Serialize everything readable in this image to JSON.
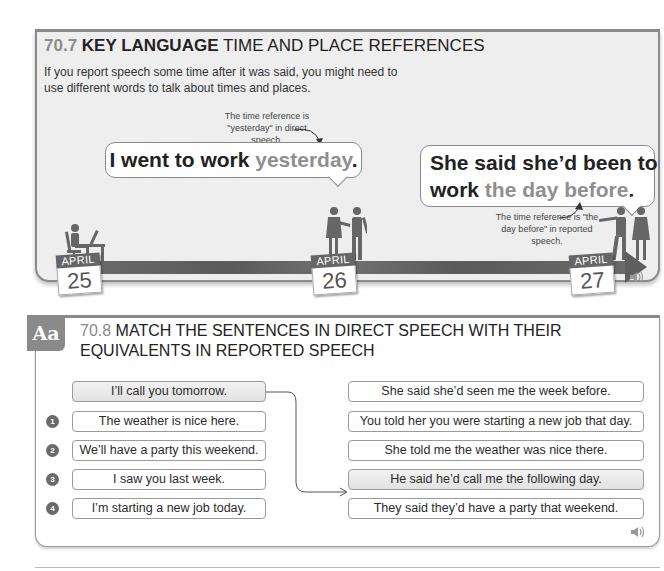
{
  "section_707": {
    "number": "70.7",
    "title_bold": "KEY LANGUAGE",
    "title_rest": "TIME AND PLACE REFERENCES",
    "intro": "If you report speech some time after it was said, you might need to use different words to talk about times and places.",
    "note_direct": "The time reference is \"yesterday\" in direct speech.",
    "note_reported": "The time reference is \"the day before\" in reported speech.",
    "bubble_direct": {
      "plain": "I went to work ",
      "highlight": "yesterday",
      "end": "."
    },
    "bubble_reported": {
      "plain_line1": "She said she’d been to",
      "plain_line2": "work ",
      "highlight": "the day before",
      "end": "."
    },
    "timeline": [
      {
        "month": "APRIL",
        "day": "25",
        "scene": "person working at desk"
      },
      {
        "month": "APRIL",
        "day": "26",
        "scene": "woman and man talking"
      },
      {
        "month": "APRIL",
        "day": "27",
        "scene": "man pointing beside woman"
      }
    ],
    "audio_icon": "speaker-icon"
  },
  "section_708": {
    "badge": "Aa",
    "number": "70.8",
    "title": "MATCH THE SENTENCES IN DIRECT SPEECH WITH THEIR EQUIVALENTS IN REPORTED SPEECH",
    "example_left": "I’ll call you tomorrow.",
    "left_items": [
      {
        "n": "1",
        "text": "The weather is nice here."
      },
      {
        "n": "2",
        "text": "We’ll have a party this weekend."
      },
      {
        "n": "3",
        "text": "I saw you last week."
      },
      {
        "n": "4",
        "text": "I’m starting a new job today."
      }
    ],
    "right_items": [
      "She said she’d seen me the week before.",
      "You told her you were starting a new job that day.",
      "She told me the weather was nice there.",
      "He said he’d call me the following day.",
      "They said they’d have a party that weekend."
    ],
    "example_match_index": 3,
    "audio_icon": "speaker-icon"
  },
  "colors": {
    "accent_grey": "#8a8a8a",
    "panel_bg": "#eeeeee",
    "text": "#2b2b2b"
  }
}
